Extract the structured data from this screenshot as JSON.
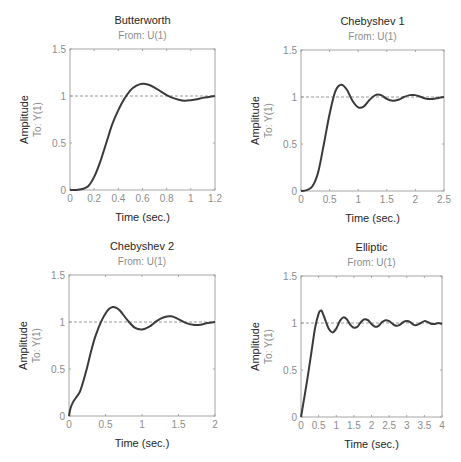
{
  "figure": {
    "colors": {
      "curve": "#3a3a3a",
      "axes": "#a6a6a6",
      "reference": "#8c8c8c",
      "text": "#262626",
      "subtext": "#8c8c8c"
    }
  },
  "chart_data": [
    {
      "type": "line",
      "title": "Butterworth",
      "subtitle": "From: U(1)",
      "xlabel": "Time (sec.)",
      "ylabel": "Amplitude",
      "ylabel_sub": "To: Y(1)",
      "xlim": [
        0,
        1.2
      ],
      "ylim": [
        0,
        1.5
      ],
      "xticks": [
        "0",
        "0.2",
        "0.4",
        "0.6",
        "0.8",
        "1",
        "1.2"
      ],
      "yticks": [
        "0",
        "0.5",
        "1",
        "1.5"
      ],
      "reference_line": 1,
      "grid": false,
      "x": [
        0,
        0.05,
        0.1,
        0.15,
        0.2,
        0.25,
        0.3,
        0.35,
        0.4,
        0.45,
        0.5,
        0.55,
        0.6,
        0.65,
        0.7,
        0.75,
        0.8,
        0.85,
        0.9,
        0.95,
        1.0,
        1.05,
        1.1,
        1.15,
        1.2
      ],
      "y": [
        0,
        0,
        0.01,
        0.04,
        0.14,
        0.3,
        0.5,
        0.7,
        0.85,
        0.97,
        1.06,
        1.11,
        1.13,
        1.12,
        1.09,
        1.05,
        1.01,
        0.98,
        0.96,
        0.95,
        0.955,
        0.965,
        0.98,
        0.99,
        1.0
      ]
    },
    {
      "type": "line",
      "title": "Chebyshev 1",
      "subtitle": "From: U(1)",
      "xlabel": "Time (sec.)",
      "ylabel": "Amplitude",
      "ylabel_sub": "To: Y(1)",
      "xlim": [
        0,
        2.5
      ],
      "ylim": [
        0,
        1.5
      ],
      "xticks": [
        "0",
        "0.5",
        "1",
        "1.5",
        "2",
        "2.5"
      ],
      "yticks": [
        "0",
        "0.5",
        "1",
        "1.5"
      ],
      "reference_line": 1,
      "grid": false,
      "x": [
        0,
        0.1,
        0.2,
        0.3,
        0.4,
        0.5,
        0.6,
        0.7,
        0.8,
        0.9,
        1.0,
        1.1,
        1.2,
        1.3,
        1.4,
        1.5,
        1.6,
        1.7,
        1.8,
        1.9,
        2.0,
        2.1,
        2.2,
        2.3,
        2.4,
        2.5
      ],
      "y": [
        0,
        0.01,
        0.05,
        0.2,
        0.5,
        0.82,
        1.06,
        1.13,
        1.08,
        0.96,
        0.89,
        0.9,
        0.97,
        1.02,
        1.02,
        0.98,
        0.96,
        0.97,
        1.0,
        1.02,
        1.02,
        1.0,
        0.98,
        0.98,
        0.99,
        1.0
      ]
    },
    {
      "type": "line",
      "title": "Chebyshev 2",
      "subtitle": "From: U(1)",
      "xlabel": "Time (sec.)",
      "ylabel": "Amplitude",
      "ylabel_sub": "To: Y(1)",
      "xlim": [
        0,
        2
      ],
      "ylim": [
        0,
        1.5
      ],
      "xticks": [
        "0",
        "0.5",
        "1",
        "1.5",
        "2"
      ],
      "yticks": [
        "0",
        "0.5",
        "1",
        "1.5"
      ],
      "reference_line": 1,
      "grid": false,
      "x": [
        0,
        0.02,
        0.05,
        0.1,
        0.15,
        0.2,
        0.25,
        0.3,
        0.35,
        0.4,
        0.45,
        0.5,
        0.55,
        0.6,
        0.65,
        0.7,
        0.8,
        0.9,
        1.0,
        1.1,
        1.2,
        1.3,
        1.4,
        1.5,
        1.6,
        1.7,
        1.8,
        1.9,
        2.0
      ],
      "y": [
        0,
        0.08,
        0.14,
        0.2,
        0.26,
        0.38,
        0.52,
        0.68,
        0.82,
        0.93,
        1.02,
        1.09,
        1.14,
        1.16,
        1.15,
        1.12,
        1.02,
        0.94,
        0.92,
        0.95,
        1.01,
        1.05,
        1.06,
        1.03,
        0.99,
        0.97,
        0.97,
        0.99,
        1.0
      ]
    },
    {
      "type": "line",
      "title": "Elliptic",
      "subtitle": "From: U(1)",
      "xlabel": "Time (sec.)",
      "ylabel": "Amplitude",
      "ylabel_sub": "To: Y(1)",
      "xlim": [
        0,
        4
      ],
      "ylim": [
        0,
        1.5
      ],
      "xticks": [
        "0",
        "0.5",
        "1",
        "1.5",
        "2",
        "2.5",
        "3",
        "3.5",
        "4"
      ],
      "yticks": [
        "0",
        "0.5",
        "1",
        "1.5"
      ],
      "reference_line": 1,
      "grid": false,
      "x": [
        0,
        0.1,
        0.2,
        0.3,
        0.4,
        0.5,
        0.55,
        0.6,
        0.7,
        0.8,
        0.9,
        1.0,
        1.1,
        1.2,
        1.3,
        1.4,
        1.5,
        1.6,
        1.7,
        1.8,
        1.9,
        2.0,
        2.1,
        2.2,
        2.3,
        2.4,
        2.5,
        2.6,
        2.7,
        2.8,
        2.9,
        3.0,
        3.1,
        3.2,
        3.3,
        3.4,
        3.5,
        3.6,
        3.7,
        3.8,
        3.9,
        4.0
      ],
      "y": [
        0,
        0.22,
        0.45,
        0.7,
        0.95,
        1.1,
        1.13,
        1.12,
        1.02,
        0.93,
        0.9,
        0.94,
        1.02,
        1.06,
        1.04,
        0.98,
        0.95,
        0.96,
        1.01,
        1.04,
        1.03,
        0.99,
        0.96,
        0.97,
        1.01,
        1.03,
        1.02,
        0.99,
        0.97,
        0.98,
        1.01,
        1.02,
        1.01,
        0.98,
        0.98,
        1.0,
        1.02,
        1.01,
        0.99,
        0.99,
        1.0,
        0.99
      ]
    }
  ],
  "layout": [
    {
      "left": 70,
      "top": 49,
      "right": 215,
      "bottom": 190
    },
    {
      "left": 301,
      "top": 50,
      "right": 444,
      "bottom": 191
    },
    {
      "left": 69,
      "top": 275,
      "right": 215,
      "bottom": 416
    },
    {
      "left": 301,
      "top": 276,
      "right": 442,
      "bottom": 417
    }
  ]
}
